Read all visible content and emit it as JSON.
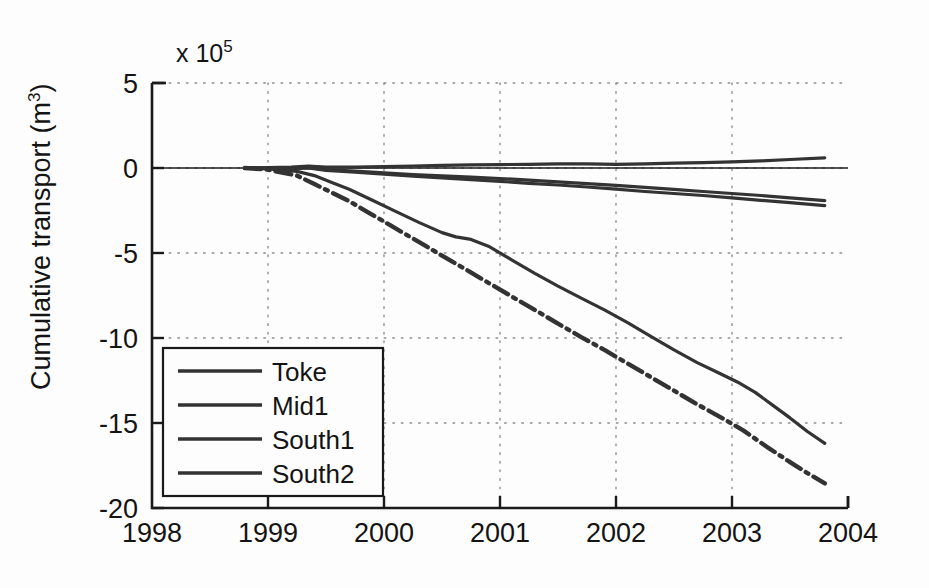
{
  "figure": {
    "background_color": "#fdfdfd",
    "line_color": "#333333",
    "axis_color": "#1a1a1a",
    "grid_color": "#9a9a9a"
  },
  "axes": {
    "exponent_prefix": "x 10",
    "exponent_power": "5",
    "y_title_main": "Cumulative transport (m",
    "y_title_sup": "3",
    "y_title_close": ")",
    "y_ticks": [
      "5",
      "0",
      "-5",
      "-10",
      "-15",
      "-20"
    ],
    "x_ticks": [
      "1998",
      "1999",
      "2000",
      "2001",
      "2002",
      "2003",
      "2004"
    ]
  },
  "legend": {
    "entries": [
      {
        "label": "Toke",
        "style": "solid"
      },
      {
        "label": "Mid1",
        "style": "solid"
      },
      {
        "label": "South1",
        "style": "solid"
      },
      {
        "label": "South2",
        "style": "solid"
      }
    ]
  },
  "chart_data": {
    "type": "line",
    "title": "",
    "xlabel": "",
    "ylabel": "Cumulative transport (m^3)",
    "y_scale_exponent": 5,
    "xlim": [
      1998,
      2004
    ],
    "ylim": [
      -20,
      5
    ],
    "xticks": [
      1998,
      1999,
      2000,
      2001,
      2002,
      2003,
      2004
    ],
    "yticks": [
      5,
      0,
      -5,
      -10,
      -15,
      -20
    ],
    "grid": true,
    "grid_style": "dotted",
    "legend_position": "lower left",
    "units_note": "y values are in units of 1e5 m^3",
    "series": [
      {
        "name": "Toke",
        "style": "solid",
        "x": [
          1998.8,
          1999.0,
          1999.2,
          1999.35,
          1999.5,
          1999.75,
          2000.0,
          2000.25,
          2000.5,
          2000.75,
          2001.0,
          2001.25,
          2001.5,
          2001.75,
          2002.0,
          2002.25,
          2002.5,
          2002.75,
          2003.0,
          2003.25,
          2003.5,
          2003.8
        ],
        "y": [
          0.0,
          0.02,
          0.05,
          0.12,
          0.06,
          0.05,
          0.08,
          0.12,
          0.16,
          0.18,
          0.2,
          0.22,
          0.24,
          0.24,
          0.22,
          0.24,
          0.28,
          0.32,
          0.36,
          0.42,
          0.5,
          0.6
        ]
      },
      {
        "name": "Mid1",
        "style": "solid",
        "x": [
          1998.8,
          1999.0,
          1999.2,
          1999.35,
          1999.5,
          1999.75,
          2000.0,
          2000.25,
          2000.5,
          2000.75,
          2001.0,
          2001.25,
          2001.5,
          2001.75,
          2002.0,
          2002.25,
          2002.5,
          2002.75,
          2003.0,
          2003.25,
          2003.5,
          2003.8
        ],
        "y": [
          0.0,
          -0.02,
          -0.04,
          0.02,
          -0.1,
          -0.18,
          -0.28,
          -0.38,
          -0.46,
          -0.54,
          -0.62,
          -0.72,
          -0.82,
          -0.92,
          -1.02,
          -1.14,
          -1.26,
          -1.38,
          -1.5,
          -1.62,
          -1.75,
          -1.92
        ]
      },
      {
        "name": "South1",
        "style": "solid",
        "x": [
          1998.8,
          1999.0,
          1999.2,
          1999.35,
          1999.5,
          1999.75,
          2000.0,
          2000.25,
          2000.5,
          2000.75,
          2001.0,
          2001.25,
          2001.5,
          2001.75,
          2002.0,
          2002.25,
          2002.5,
          2002.75,
          2003.0,
          2003.25,
          2003.5,
          2003.8
        ],
        "y": [
          0.0,
          -0.02,
          -0.06,
          0.0,
          -0.14,
          -0.24,
          -0.36,
          -0.48,
          -0.58,
          -0.68,
          -0.78,
          -0.9,
          -1.0,
          -1.12,
          -1.24,
          -1.38,
          -1.5,
          -1.62,
          -1.76,
          -1.9,
          -2.04,
          -2.22
        ]
      },
      {
        "name": "South1-transport",
        "style": "solid",
        "x": [
          1998.8,
          1999.0,
          1999.25,
          1999.4,
          1999.55,
          1999.7,
          1999.9,
          2000.1,
          2000.3,
          2000.5,
          2000.62,
          2000.75,
          2000.9,
          2001.1,
          2001.3,
          2001.5,
          2001.7,
          2001.9,
          2002.1,
          2002.3,
          2002.5,
          2002.7,
          2002.9,
          2003.05,
          2003.2,
          2003.35,
          2003.5,
          2003.65,
          2003.8
        ],
        "y": [
          0.0,
          -0.05,
          -0.2,
          -0.45,
          -0.85,
          -1.25,
          -1.9,
          -2.55,
          -3.2,
          -3.8,
          -4.05,
          -4.2,
          -4.6,
          -5.4,
          -6.2,
          -6.95,
          -7.65,
          -8.35,
          -9.1,
          -9.9,
          -10.7,
          -11.45,
          -12.1,
          -12.6,
          -13.2,
          -13.95,
          -14.7,
          -15.5,
          -16.2
        ]
      },
      {
        "name": "South2",
        "style": "dashdot",
        "x": [
          1998.8,
          1999.0,
          1999.25,
          1999.4,
          1999.55,
          1999.7,
          1999.9,
          2000.1,
          2000.3,
          2000.5,
          2000.7,
          2000.9,
          2001.1,
          2001.3,
          2001.5,
          2001.7,
          2001.9,
          2002.1,
          2002.3,
          2002.5,
          2002.7,
          2002.9,
          2003.1,
          2003.3,
          2003.5,
          2003.65,
          2003.8
        ],
        "y": [
          0.0,
          -0.1,
          -0.45,
          -0.95,
          -1.45,
          -1.95,
          -2.75,
          -3.55,
          -4.35,
          -5.15,
          -5.95,
          -6.75,
          -7.55,
          -8.35,
          -9.15,
          -9.95,
          -10.7,
          -11.5,
          -12.3,
          -13.1,
          -13.9,
          -14.65,
          -15.45,
          -16.4,
          -17.3,
          -17.95,
          -18.55
        ]
      }
    ]
  }
}
